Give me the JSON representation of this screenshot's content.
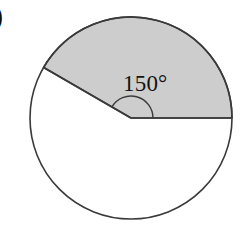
{
  "figure": {
    "type": "circle-sector-diagram",
    "background_color": "#ffffff",
    "circle": {
      "center_x": 131,
      "center_y": 118,
      "radius": 101,
      "stroke_color": "#3a3a3a",
      "stroke_width": 1.6,
      "fill_color": "#ffffff"
    },
    "shaded_sector": {
      "label": "150°",
      "angle_degrees": 150,
      "start_angle_degrees": 0,
      "end_angle_degrees": 150,
      "fill_color": "#cdcdcd",
      "stroke_color": "#3a3a3a"
    },
    "unshaded_sector": {
      "angle_degrees": 210,
      "fill_color": "#ffffff"
    },
    "radii": [
      {
        "name": "horizontal-radius",
        "angle_degrees": 0,
        "end_x": 232,
        "end_y": 118
      },
      {
        "name": "upper-left-radius",
        "angle_degrees": 150,
        "end_x": 43,
        "end_y": 67
      }
    ],
    "angle_arc": {
      "radius": 22,
      "stroke_color": "#3a3a3a",
      "stroke_width": 1.4
    },
    "angle_label": {
      "text": "150°",
      "value": "150",
      "unit": "°",
      "x": 123,
      "y": 91,
      "font_size": 23,
      "color": "#131313"
    },
    "item_marker": {
      "text": ")",
      "x": -6,
      "y": 25,
      "clipped": true,
      "color": "#0d0d0d"
    }
  }
}
